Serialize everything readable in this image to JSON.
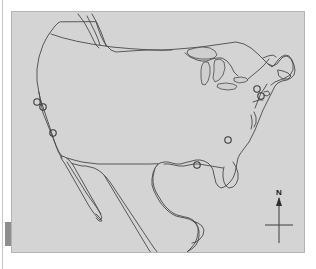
{
  "figure": {
    "kind": "outline-map",
    "region": "North America (contiguous United States, Mexico, southern Canada)",
    "background_color": "#ffffff",
    "map_fill_color": "#d4d4d4",
    "map_border_color": "#b4b4b4",
    "coastline_color": "#4a4a4a",
    "marker_color": "#3a3a3a",
    "margin_block_color": "#8e8e8e"
  },
  "compass": {
    "name": "north-arrow",
    "label": "N",
    "label_color": "#1a1a1a"
  },
  "markers": {
    "count": 6,
    "symbol": "open-circle",
    "radius_px": 3.2,
    "points": [
      {
        "id": "marker-1",
        "x": 25,
        "y": 90,
        "cluster": "west-coast-north"
      },
      {
        "id": "marker-2",
        "x": 31,
        "y": 95,
        "cluster": "west-coast-north"
      },
      {
        "id": "marker-3",
        "x": 41,
        "y": 121,
        "cluster": "west-coast-south"
      },
      {
        "id": "marker-4",
        "x": 185,
        "y": 155,
        "cluster": "gulf-coast"
      },
      {
        "id": "marker-5",
        "x": 216,
        "y": 128,
        "cluster": "interior-southeast"
      },
      {
        "id": "marker-6",
        "x": 245,
        "y": 77,
        "cluster": "northeast-coast"
      },
      {
        "id": "marker-7",
        "x": 249,
        "y": 83,
        "cluster": "northeast-coast"
      }
    ]
  },
  "geography": {
    "features": [
      "pacific-coastline",
      "us-canada-border-49th-parallel",
      "great-lakes",
      "atlantic-coastline",
      "florida-peninsula",
      "gulf-of-mexico",
      "baja-california-peninsula",
      "yucatan-peninsula",
      "maritime-canada"
    ]
  }
}
